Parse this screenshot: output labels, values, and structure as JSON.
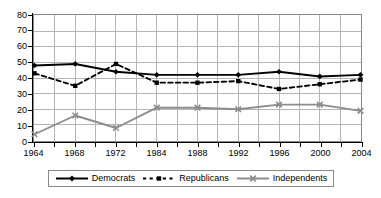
{
  "chart_data": {
    "type": "line",
    "title": "",
    "subtitle": "",
    "xlabel": "",
    "ylabel": "",
    "x": [
      1964,
      1968,
      1972,
      1984,
      1988,
      1992,
      1996,
      2000,
      2004
    ],
    "categories": [
      "1964",
      "1968",
      "1972",
      "1984",
      "1988",
      "1992",
      "1996",
      "2000",
      "2004"
    ],
    "xlim": [
      1964,
      2004
    ],
    "ylim": [
      0,
      80
    ],
    "y_ticks": [
      0,
      10,
      20,
      30,
      40,
      50,
      60,
      70,
      80
    ],
    "y_tick_labels": [
      "0",
      "10",
      "20",
      "30",
      "40",
      "50",
      "60",
      "70",
      "80"
    ],
    "grid": true,
    "grid_minor_vertical": true,
    "legend_position": "bottom",
    "series": [
      {
        "name": "Democrats",
        "values": [
          48,
          49,
          44,
          42,
          42,
          42,
          44,
          41,
          42
        ],
        "color": "#000000",
        "line_style": "solid",
        "marker": "diamond"
      },
      {
        "name": "Republicans",
        "values": [
          43,
          35,
          49,
          37,
          37,
          38,
          33,
          36,
          39
        ],
        "color": "#000000",
        "line_style": "dashed",
        "marker": "square"
      },
      {
        "name": "Independents",
        "values": [
          4,
          16,
          8,
          21,
          21,
          20,
          23,
          23,
          19
        ],
        "color": "#8c8c8c",
        "line_style": "solid",
        "marker": "x"
      }
    ]
  },
  "legend": {
    "entries": [
      {
        "label": "Democrats"
      },
      {
        "label": "Republicans"
      },
      {
        "label": "Independents"
      }
    ]
  },
  "colors": {
    "democrats": "#000000",
    "republicans": "#000000",
    "independents": "#8c8c8c",
    "grid": "#b4b4b4",
    "axis": "#000000",
    "plot_border": "#8a8a8a",
    "background": "#ffffff"
  }
}
